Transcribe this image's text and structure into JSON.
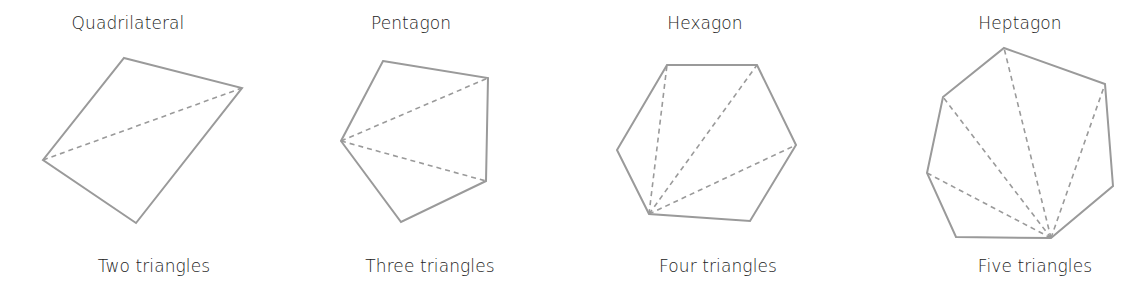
{
  "diagram": {
    "stroke_color": "#9a9a9a",
    "panels": [
      {
        "title": "Quadrilateral",
        "caption": "Two triangles",
        "sides": 4,
        "triangles": 2,
        "vertices": [
          [
            124,
            58
          ],
          [
            242,
            88
          ],
          [
            136,
            223
          ],
          [
            43,
            160
          ]
        ],
        "diagonals_from": [
          43,
          160
        ],
        "diagonals_to": [
          [
            242,
            88
          ]
        ]
      },
      {
        "title": "Pentagon",
        "caption": "Three triangles",
        "sides": 5,
        "triangles": 3,
        "vertices": [
          [
            383,
            61
          ],
          [
            488,
            78
          ],
          [
            486,
            181
          ],
          [
            401,
            222
          ],
          [
            341,
            141
          ]
        ],
        "diagonals_from": [
          341,
          141
        ],
        "diagonals_to": [
          [
            488,
            78
          ],
          [
            486,
            181
          ]
        ]
      },
      {
        "title": "Hexagon",
        "caption": "Four triangles",
        "sides": 6,
        "triangles": 4,
        "vertices": [
          [
            667,
            65
          ],
          [
            757,
            65
          ],
          [
            796,
            145
          ],
          [
            750,
            221
          ],
          [
            649,
            214
          ],
          [
            617,
            150
          ]
        ],
        "diagonals_from": [
          649,
          214
        ],
        "diagonals_to": [
          [
            667,
            65
          ],
          [
            757,
            65
          ],
          [
            796,
            145
          ]
        ]
      },
      {
        "title": "Heptagon",
        "caption": "Five triangles",
        "sides": 7,
        "triangles": 5,
        "vertices": [
          [
            1004,
            48
          ],
          [
            1105,
            84
          ],
          [
            1113,
            186
          ],
          [
            1051,
            238
          ],
          [
            956,
            237
          ],
          [
            927,
            173
          ],
          [
            943,
            97
          ]
        ],
        "diagonals_from": [
          1051,
          238
        ],
        "diagonals_to": [
          [
            943,
            97
          ],
          [
            1004,
            48
          ],
          [
            1105,
            84
          ],
          [
            927,
            173
          ]
        ]
      }
    ]
  }
}
